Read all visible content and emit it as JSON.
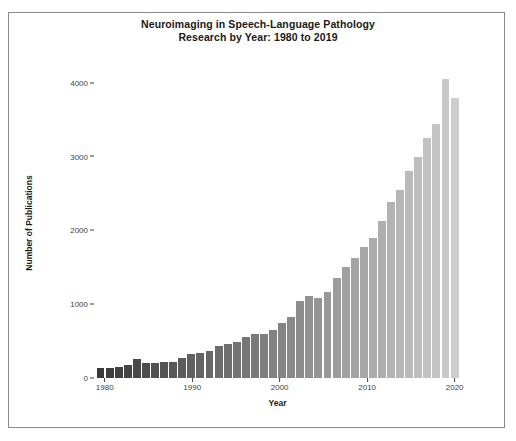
{
  "chart_data": {
    "type": "bar",
    "title": "Neuroimaging in Speech-Language Pathology\nResearch by Year: 1980 to 2019",
    "title_line1": "Neuroimaging in Speech-Language Pathology",
    "title_line2": "Research by Year: 1980 to 2019",
    "xlabel": "Year",
    "ylabel": "Number of Publications",
    "xlim": [
      1979,
      2020.5
    ],
    "ylim": [
      0,
      4200
    ],
    "grid": false,
    "legend": null,
    "xticks": [
      1980,
      1990,
      2000,
      2010,
      2020
    ],
    "xtick_labels": [
      "1980",
      "1990",
      "2000",
      "2010",
      "2020"
    ],
    "yticks": [
      0,
      1000,
      2000,
      3000,
      4000
    ],
    "ytick_labels": [
      "0",
      "1000",
      "2000",
      "3000",
      "4000"
    ],
    "bar_color_start": "#3a3a3a",
    "bar_color_end": "#cdcdcd",
    "categories": [
      "1980",
      "1981",
      "1982",
      "1983",
      "1984",
      "1985",
      "1986",
      "1987",
      "1988",
      "1989",
      "1990",
      "1991",
      "1992",
      "1993",
      "1994",
      "1995",
      "1996",
      "1997",
      "1998",
      "1999",
      "2000",
      "2001",
      "2002",
      "2003",
      "2004",
      "2005",
      "2006",
      "2007",
      "2008",
      "2009",
      "2010",
      "2011",
      "2012",
      "2013",
      "2014",
      "2015",
      "2016",
      "2017",
      "2018",
      "2019"
    ],
    "values": [
      130,
      135,
      150,
      175,
      255,
      205,
      200,
      215,
      215,
      270,
      325,
      340,
      365,
      430,
      455,
      490,
      560,
      600,
      600,
      650,
      745,
      820,
      1050,
      1110,
      1090,
      1170,
      1350,
      1500,
      1620,
      1780,
      1900,
      2130,
      2390,
      2550,
      2800,
      2990,
      3250,
      3440,
      4050,
      3800
    ]
  }
}
